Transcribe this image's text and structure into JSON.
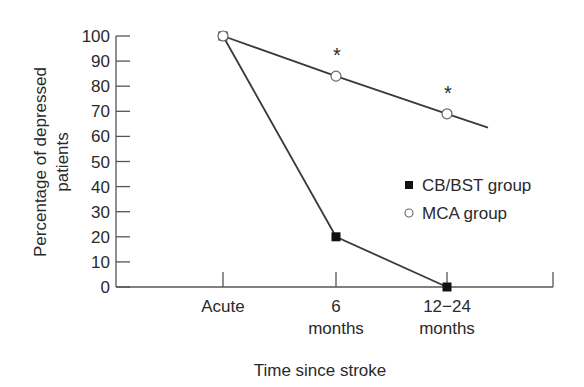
{
  "chart_data": {
    "type": "line",
    "title": "",
    "xlabel": "Time since stroke",
    "ylabel": [
      "Percentage of depressed",
      "patients"
    ],
    "ylim": [
      0,
      100
    ],
    "yticks": [
      0,
      10,
      20,
      30,
      40,
      50,
      60,
      70,
      80,
      90,
      100
    ],
    "categories": [
      {
        "label": [
          "Acute"
        ]
      },
      {
        "label": [
          "6",
          "months"
        ]
      },
      {
        "label": [
          "12−24",
          "months"
        ]
      }
    ],
    "series": [
      {
        "name": "CB/BST group",
        "marker": "filled-square",
        "values": [
          100,
          20,
          0
        ]
      },
      {
        "name": "MCA group",
        "marker": "open-circle",
        "values": [
          100,
          84,
          69
        ],
        "line_extends_beyond_last": true,
        "extension_value": 63
      }
    ],
    "annotations": [
      {
        "text": "*",
        "category_index": 1,
        "series": "MCA group"
      },
      {
        "text": "*",
        "category_index": 2,
        "series": "MCA group"
      }
    ],
    "legend": {
      "position": "right",
      "entries": [
        "CB/BST group",
        "MCA group"
      ]
    },
    "grid": false
  }
}
